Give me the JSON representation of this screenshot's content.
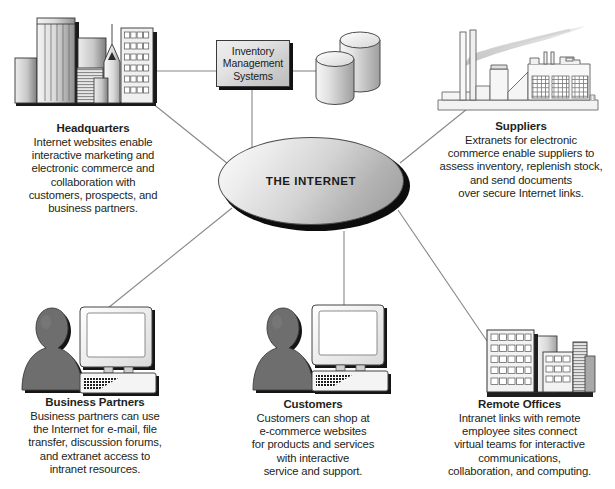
{
  "diagram": {
    "center": {
      "label": "THE INTERNET",
      "shape": "ellipse"
    },
    "inventory_box": {
      "lines": [
        "Inventory",
        "Management",
        "Systems"
      ],
      "icon": "database-cylinders-icon"
    },
    "nodes": [
      {
        "id": "headquarters",
        "title": "Headquarters",
        "icon": "city-skyline-icon",
        "desc_lines": [
          "Internet websites enable",
          "interactive marketing and",
          "electronic commerce and",
          "collaboration with",
          "customers, prospects, and",
          "business partners."
        ]
      },
      {
        "id": "suppliers",
        "title": "Suppliers",
        "icon": "factory-icon",
        "desc_lines": [
          "Extranets for electronic",
          "commerce enable suppliers to",
          "assess inventory, replenish stock,",
          "and send documents",
          "over secure Internet links."
        ]
      },
      {
        "id": "business-partners",
        "title": "Business Partners",
        "icon": "person-and-computer-icon",
        "desc_lines": [
          "Business partners can use",
          "the Internet for e-mail, file",
          "transfer, discussion forums,",
          "and extranet access to",
          "intranet resources."
        ]
      },
      {
        "id": "customers",
        "title": "Customers",
        "icon": "person-and-computer-icon",
        "desc_lines": [
          "Customers can shop at",
          "e-commerce websites",
          "for products and services",
          "with interactive",
          "service and support."
        ]
      },
      {
        "id": "remote-offices",
        "title": "Remote Offices",
        "icon": "office-buildings-icon",
        "desc_lines": [
          "Intranet links with remote",
          "employee sites connect",
          "virtual teams for interactive",
          "communications,",
          "collaboration, and computing."
        ]
      }
    ],
    "colors": {
      "line": "#808080",
      "text": "#231f20",
      "fill_dark": "#6e6e6e",
      "fill_mid": "#b8b8b8",
      "fill_light": "#f2f2f2",
      "outline": "#333333"
    }
  }
}
